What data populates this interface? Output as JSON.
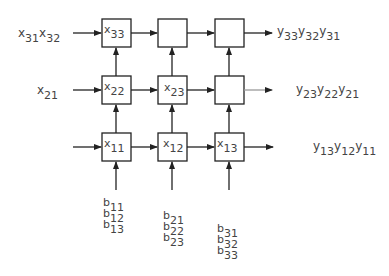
{
  "diagram": {
    "type": "systolic-array",
    "grid": {
      "rows": 3,
      "cols": 3
    },
    "row_inputs": [
      {
        "row": "top",
        "base": "x",
        "subs": [
          "31",
          "32"
        ]
      },
      {
        "row": "middle",
        "base": "x",
        "subs": [
          "21"
        ]
      },
      {
        "row": "bottom",
        "base": "",
        "subs": []
      }
    ],
    "cells": [
      {
        "id": "c-top-1",
        "base": "x",
        "sub": "33"
      },
      {
        "id": "c-top-2",
        "base": "",
        "sub": ""
      },
      {
        "id": "c-top-3",
        "base": "",
        "sub": ""
      },
      {
        "id": "c-mid-1",
        "base": "x",
        "sub": "22"
      },
      {
        "id": "c-mid-2",
        "base": "x",
        "sub": "23"
      },
      {
        "id": "c-mid-3",
        "base": "",
        "sub": ""
      },
      {
        "id": "c-bot-1",
        "base": "x",
        "sub": "11"
      },
      {
        "id": "c-bot-2",
        "base": "x",
        "sub": "12"
      },
      {
        "id": "c-bot-3",
        "base": "x",
        "sub": "13"
      }
    ],
    "row_outputs": [
      {
        "row": "top",
        "base": "y",
        "subs": [
          "33",
          "32",
          "31"
        ]
      },
      {
        "row": "middle",
        "base": "y",
        "subs": [
          "23",
          "22",
          "21"
        ]
      },
      {
        "row": "bottom",
        "base": "y",
        "subs": [
          "13",
          "12",
          "11"
        ]
      }
    ],
    "column_inputs": [
      {
        "col": 1,
        "base": "b",
        "subs": [
          "11",
          "12",
          "13"
        ]
      },
      {
        "col": 2,
        "base": "b",
        "subs": [
          "21",
          "22",
          "23"
        ]
      },
      {
        "col": 3,
        "base": "b",
        "subs": [
          "31",
          "32",
          "33"
        ]
      }
    ]
  }
}
